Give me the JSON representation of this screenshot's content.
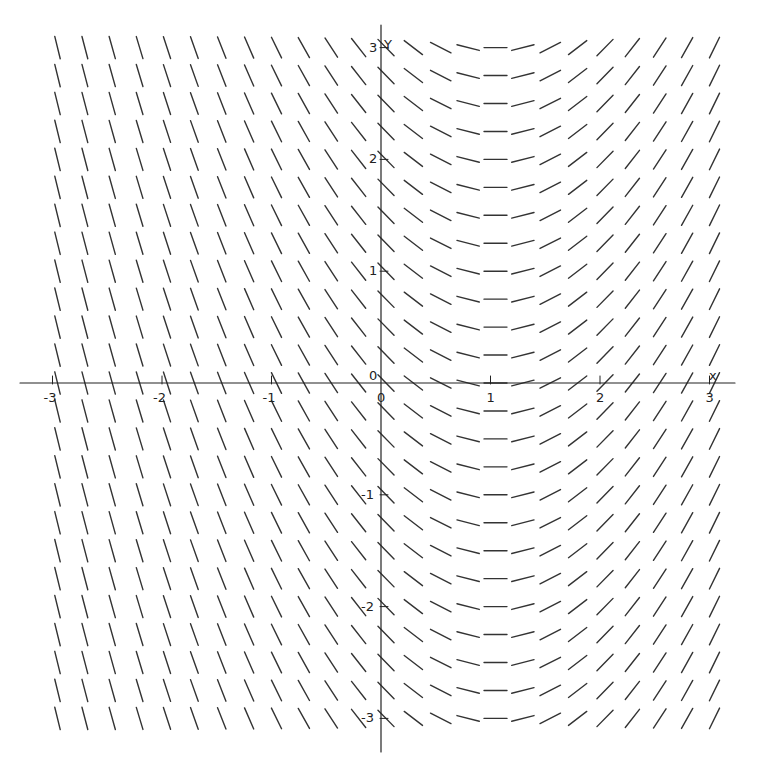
{
  "chart_data": {
    "type": "slope_field",
    "title": "",
    "equation_inferred": "dy/dx = x - 1",
    "xlabel": "x",
    "ylabel": "Y",
    "xlim": [
      -3.2,
      3.1
    ],
    "ylim": [
      -3.3,
      3.3
    ],
    "x_ticks": [
      -3,
      -2,
      -1,
      0,
      1,
      2,
      3
    ],
    "y_ticks": [
      -3,
      -2,
      -1,
      1,
      2,
      3
    ],
    "x_tick_labels": [
      "-3",
      "-2",
      "-1",
      "0",
      "1",
      "2",
      "3"
    ],
    "y_tick_labels": [
      "-3",
      "-2",
      "-1",
      "1",
      "2",
      "3"
    ],
    "origin_label": "0",
    "grid_step": 0.25,
    "x_range_segments": [
      -3,
      3
    ],
    "y_range_segments": [
      -3,
      3.1
    ],
    "segment_color": "#333333",
    "axis_color": "#222222",
    "grid": false,
    "legend": false
  },
  "axes": {
    "x_label": "x",
    "y_label": "Y",
    "origin": "0"
  }
}
